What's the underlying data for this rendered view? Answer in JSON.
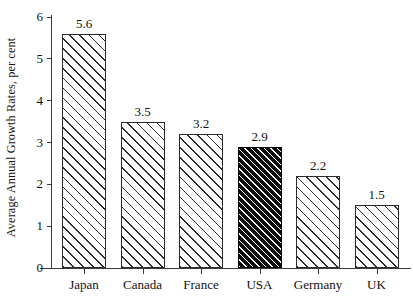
{
  "chart_data": {
    "type": "bar",
    "title": "",
    "subtitle": "",
    "xlabel": "",
    "ylabel": "Average Annual Growth Rates, per cent",
    "categories": [
      "Japan",
      "Canada",
      "France",
      "USA",
      "Germany",
      "UK"
    ],
    "values": [
      5.6,
      3.5,
      3.2,
      2.9,
      2.2,
      1.5
    ],
    "value_labels": [
      "5.6",
      "3.5",
      "3.2",
      "2.9",
      "2.2",
      "1.5"
    ],
    "ylim": [
      0,
      6
    ],
    "ytick_values": [
      0,
      1,
      2,
      3,
      4,
      5,
      6
    ],
    "ytick_labels": [
      "0",
      "1",
      "2",
      "3",
      "4",
      "5",
      "6"
    ],
    "grid": false,
    "legend": null,
    "legend_position": "none",
    "highlighted_category": "USA",
    "highlighted_index": 3,
    "bar_style": {
      "fill": "#ffffff",
      "hatch": "diagonal-45",
      "edge_color": "#2b2b2b",
      "highlight_fill": "#0b0b0b",
      "highlight_hatch_color": "#ffffff"
    },
    "axis_color": "#3a3a3a",
    "background": "#ffffff"
  }
}
